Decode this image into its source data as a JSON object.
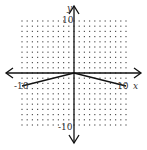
{
  "chart_data": {
    "type": "line",
    "title": "",
    "xlabel": "x",
    "ylabel": "y",
    "xlim": [
      -10,
      10
    ],
    "ylim": [
      -10,
      10
    ],
    "grid": "dotted",
    "tick_step": 1,
    "tick_labels": {
      "x_min": "-10",
      "x_max": "10",
      "y_min": "-10",
      "y_max": "10"
    },
    "series": [
      {
        "name": "f(x) = -|x|/4",
        "x": [
          -10,
          0,
          10
        ],
        "y": [
          -2.5,
          0,
          -2.5
        ]
      }
    ]
  },
  "colors": {
    "axis": "#111111",
    "grid_dot": "#555555",
    "line": "#111111"
  }
}
